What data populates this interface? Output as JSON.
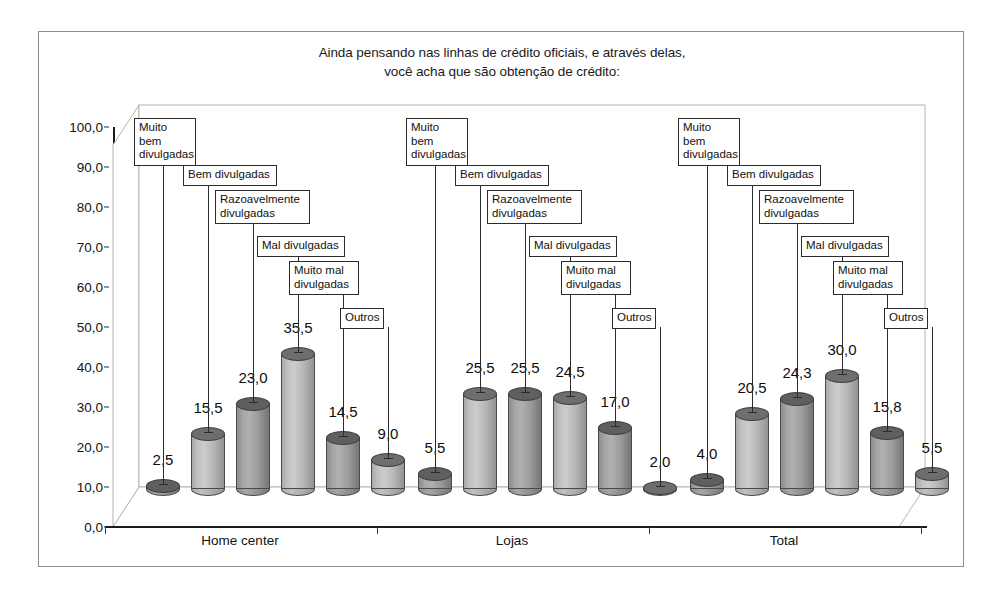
{
  "chart_data": {
    "type": "bar",
    "title": "Ainda pensando nas linhas de crédito oficiais, e através delas, você acha que são obtenção de crédito:",
    "title_lines": [
      "Ainda pensando nas linhas de crédito oficiais, e através delas,",
      "você acha que são obtenção de crédito:"
    ],
    "xlabel": "",
    "ylabel": "",
    "ylim": [
      0,
      100
    ],
    "ytick_labels": [
      "0,0",
      "10,0",
      "20,0",
      "30,0",
      "40,0",
      "50,0",
      "60,0",
      "70,0",
      "80,0",
      "90,0",
      "100,0"
    ],
    "ytick_values": [
      0,
      10,
      20,
      30,
      40,
      50,
      60,
      70,
      80,
      90,
      100
    ],
    "grid": false,
    "legend_position": "none",
    "categories": [
      "Home center",
      "Lojas",
      "Total"
    ],
    "series": [
      {
        "name": "Muito bem divulgadas",
        "values": [
          2.5,
          5.5,
          4.0
        ],
        "labels": [
          "2,5",
          "5,5",
          "4,0"
        ]
      },
      {
        "name": "Bem divulgadas",
        "values": [
          15.5,
          25.5,
          20.5
        ],
        "labels": [
          "15,5",
          "25,5",
          "20,5"
        ]
      },
      {
        "name": "Razoavelmente divulgadas",
        "values": [
          23.0,
          25.5,
          24.3
        ],
        "labels": [
          "23,0",
          "25,5",
          "24,3"
        ]
      },
      {
        "name": "Mal divulgadas",
        "values": [
          35.5,
          24.5,
          30.0
        ],
        "labels": [
          "35,5",
          "24,5",
          "30,0"
        ]
      },
      {
        "name": "Muito mal divulgadas",
        "values": [
          14.5,
          17.0,
          15.8
        ],
        "labels": [
          "14,5",
          "17,0",
          "15,8"
        ]
      },
      {
        "name": "Outros",
        "values": [
          9.0,
          2.0,
          5.5
        ],
        "labels": [
          "9,0",
          "2,0",
          "5,5"
        ]
      }
    ],
    "callout_labels": [
      "Muito bem\ndivulgadas",
      "Bem divulgadas",
      "Razoavelmente\ndivulgadas",
      "Mal divulgadas",
      "Muito mal\ndivulgadas",
      "Outros"
    ],
    "colors": {
      "bar_dark": "#9a9a9a",
      "bar_light": "#bcbcbc",
      "bar_top_dark": "#5f5f5f",
      "bar_top_light": "#6e6e6e",
      "axis": "#1a1a1a",
      "frame": "#8d8d8d",
      "text": "#111111",
      "background": "#ffffff"
    }
  }
}
